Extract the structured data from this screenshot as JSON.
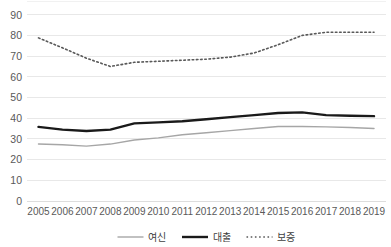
{
  "chart_data": {
    "type": "line",
    "title": "",
    "xlabel": "",
    "ylabel": "",
    "x": [
      2005,
      2006,
      2007,
      2008,
      2009,
      2010,
      2011,
      2012,
      2013,
      2014,
      2015,
      2016,
      2017,
      2018,
      2019
    ],
    "categories": [
      "2005",
      "2006",
      "2007",
      "2008",
      "2009",
      "2010",
      "2011",
      "2012",
      "2013",
      "2014",
      "2015",
      "2016",
      "2017",
      "2018",
      "2019"
    ],
    "ylim": [
      0,
      100
    ],
    "yticks": [
      0,
      10,
      20,
      30,
      40,
      50,
      60,
      70,
      80,
      90
    ],
    "ytick_labels": [
      "0",
      "10",
      "20",
      "30",
      "40",
      "50",
      "60",
      "70",
      "80",
      "90"
    ],
    "grid": true,
    "legend_position": "bottom",
    "series": [
      {
        "name": "여신",
        "style": "solid-thin",
        "color": "#a6a6a6",
        "values": [
          27.5,
          27.2,
          26.5,
          27.5,
          29.5,
          30.5,
          32.0,
          33.0,
          34.0,
          35.0,
          36.0,
          36.0,
          35.8,
          35.5,
          35.0
        ]
      },
      {
        "name": "대출",
        "style": "solid-thick",
        "color": "#1a1a1a",
        "values": [
          35.8,
          34.5,
          33.8,
          34.5,
          37.5,
          38.0,
          38.5,
          39.5,
          40.5,
          41.5,
          42.5,
          42.8,
          41.5,
          41.2,
          41.0
        ]
      },
      {
        "name": "보증",
        "style": "dotted",
        "color": "#595959",
        "values": [
          78.8,
          74.0,
          69.0,
          65.0,
          67.0,
          67.5,
          68.0,
          68.5,
          69.5,
          71.5,
          75.5,
          80.0,
          81.5,
          81.5,
          81.5
        ]
      }
    ]
  },
  "axis": {
    "y_ticks": [
      "90",
      "80",
      "70",
      "60",
      "50",
      "40",
      "30",
      "20",
      "10",
      "0"
    ],
    "x_ticks": [
      "2005",
      "2006",
      "2007",
      "2008",
      "2009",
      "2010",
      "2011",
      "2012",
      "2013",
      "2014",
      "2015",
      "2016",
      "2017",
      "2018",
      "2019"
    ]
  },
  "legend": {
    "items": [
      {
        "label": "여신",
        "color": "#a6a6a6",
        "style": "solid-thin"
      },
      {
        "label": "대출",
        "color": "#1a1a1a",
        "style": "solid-thick"
      },
      {
        "label": "보증",
        "color": "#595959",
        "style": "dotted"
      }
    ]
  },
  "colors": {
    "gridline": "#e2e2e2",
    "tick_text": "#595959",
    "background": "#ffffff"
  }
}
